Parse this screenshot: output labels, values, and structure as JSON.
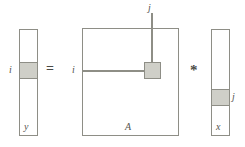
{
  "figure": {
    "background_color": "#ffffff",
    "outline_color": "#8e8e86",
    "shaded_cell_color": "#cfcfc8",
    "label_color": "#55554f"
  },
  "left_vector": {
    "name": "y",
    "index_label": "i",
    "name_label": "y",
    "highlighted_cell": "i"
  },
  "operators": {
    "equals": "=",
    "times": "*"
  },
  "matrix": {
    "name": "A",
    "name_label": "A",
    "row_index_label": "i",
    "column_index_label": "j",
    "highlighted_cell": "A(i,j)"
  },
  "right_vector": {
    "name": "x",
    "index_label": "j",
    "name_label": "x",
    "highlighted_cell": "j"
  }
}
